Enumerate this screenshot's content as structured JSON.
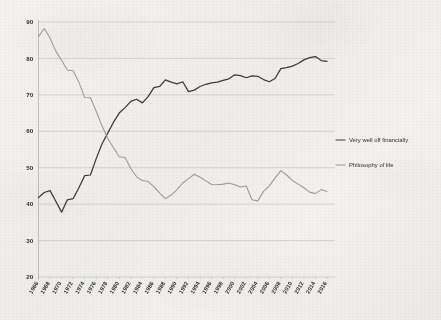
{
  "chart_data": {
    "type": "line",
    "title": "",
    "xlabel": "",
    "ylabel": "",
    "xlim": [
      1966,
      2016
    ],
    "ylim": [
      20,
      90
    ],
    "grid": true,
    "legend_position": "right",
    "y_ticks": [
      90,
      80,
      70,
      60,
      50,
      40,
      30,
      20
    ],
    "x_ticks": [
      1966,
      1968,
      1970,
      1972,
      1974,
      1976,
      1978,
      1980,
      1982,
      1984,
      1986,
      1988,
      1990,
      1992,
      1994,
      1996,
      1998,
      2000,
      2002,
      2004,
      2006,
      2008,
      2010,
      2012,
      2014,
      2016
    ],
    "x": [
      1966,
      1967,
      1968,
      1969,
      1970,
      1971,
      1972,
      1973,
      1974,
      1975,
      1976,
      1977,
      1978,
      1979,
      1980,
      1981,
      1982,
      1983,
      1984,
      1985,
      1986,
      1987,
      1988,
      1989,
      1990,
      1991,
      1992,
      1993,
      1994,
      1995,
      1996,
      1997,
      1998,
      1999,
      2000,
      2001,
      2002,
      2003,
      2004,
      2005,
      2006,
      2007,
      2008,
      2009,
      2010,
      2011,
      2012,
      2013,
      2014,
      2015,
      2016
    ],
    "series": [
      {
        "name": "Very well off financially",
        "color": "#3a3a3a",
        "values": [
          41.8,
          43.2,
          43.7,
          40.8,
          37.8,
          41.2,
          41.5,
          44.5,
          47.8,
          48.0,
          52.5,
          56.5,
          59.5,
          62.5,
          65.0,
          66.5,
          68.2,
          68.8,
          67.8,
          69.5,
          72.0,
          72.3,
          74.1,
          73.5,
          73.0,
          73.6,
          70.9,
          71.3,
          72.3,
          72.9,
          73.3,
          73.5,
          74.0,
          74.4,
          75.5,
          75.3,
          74.7,
          75.2,
          75.1,
          74.2,
          73.6,
          74.5,
          77.2,
          77.5,
          77.9,
          78.6,
          79.6,
          80.2,
          80.5,
          79.4,
          79.2
        ]
      },
      {
        "name": "Philosophy of life",
        "color": "#9a9893",
        "values": [
          86.0,
          88.2,
          85.6,
          82.0,
          79.5,
          76.8,
          76.6,
          73.5,
          69.3,
          69.2,
          65.5,
          61.5,
          58.0,
          55.5,
          53.0,
          52.8,
          49.8,
          47.5,
          46.5,
          46.2,
          44.8,
          43.0,
          41.5,
          42.5,
          44.0,
          45.8,
          47.0,
          48.2,
          47.4,
          46.4,
          45.4,
          45.3,
          45.5,
          45.8,
          45.3,
          44.7,
          45.0,
          41.2,
          40.9,
          43.5,
          45.0,
          47.2,
          49.2,
          48.0,
          46.5,
          45.5,
          44.5,
          43.3,
          42.9,
          44.0,
          43.5
        ]
      }
    ]
  },
  "legend": {
    "items": [
      {
        "label": "Very well off financially",
        "color": "#3a3a3a"
      },
      {
        "label": "Philosophy of life",
        "color": "#9a9893"
      }
    ]
  }
}
